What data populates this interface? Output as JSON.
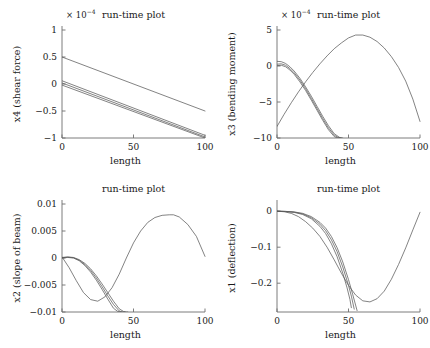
{
  "figure": {
    "title_common": "run-time plot",
    "xlabel_common": "length",
    "background": "#ffffff",
    "curve_color": "#5a5a5a",
    "axis_color": "#6e6e6e"
  },
  "chart_data": [
    {
      "id": "shear-force",
      "position": "top-left",
      "type": "line",
      "title": "run-time plot",
      "xlabel": "length",
      "ylabel": "x4 (shear force)",
      "exponent_label": "× 10",
      "exponent_power": "−4",
      "y_scale": 0.0001,
      "xlim": [
        0,
        100
      ],
      "ylim": [
        -1,
        1
      ],
      "xticks": [
        0,
        50,
        100
      ],
      "xticklabels": [
        "0",
        "50",
        "100"
      ],
      "yticks": [
        -1,
        -0.5,
        0,
        0.5,
        1
      ],
      "yticklabels": [
        "−1",
        "−0.5",
        "0",
        "0.5",
        "1"
      ],
      "grid": false,
      "legend": "none",
      "series": [
        {
          "name": "curve-1",
          "x": [
            0,
            100
          ],
          "values": [
            0.5,
            -0.5
          ]
        },
        {
          "name": "curve-2",
          "x": [
            0,
            100
          ],
          "values": [
            0.06,
            -0.95
          ]
        },
        {
          "name": "curve-3",
          "x": [
            0,
            100
          ],
          "values": [
            0.02,
            -0.98
          ]
        },
        {
          "name": "curve-4",
          "x": [
            0,
            100
          ],
          "values": [
            -0.02,
            -1.0
          ]
        }
      ]
    },
    {
      "id": "bending-moment",
      "position": "top-right",
      "type": "line",
      "title": "run-time plot",
      "xlabel": "length",
      "ylabel": "x3 (bending moment)",
      "exponent_label": "× 10",
      "exponent_power": "−4",
      "y_scale": 0.0001,
      "xlim": [
        0,
        100
      ],
      "ylim": [
        -10,
        5
      ],
      "xticks": [
        0,
        50,
        100
      ],
      "xticklabels": [
        "0",
        "50",
        "100"
      ],
      "yticks": [
        -10,
        -5,
        0,
        5
      ],
      "yticklabels": [
        "−10",
        "−5",
        "0",
        "5"
      ],
      "grid": false,
      "legend": "none",
      "series": [
        {
          "name": "parabola",
          "x": [
            0,
            5,
            10,
            15,
            20,
            25,
            30,
            35,
            40,
            45,
            50,
            55,
            60,
            65,
            70,
            75,
            80,
            85,
            90,
            95,
            100
          ],
          "values": [
            -8.4,
            -6.7,
            -5.1,
            -3.6,
            -2.2,
            -0.9,
            0.3,
            1.4,
            2.4,
            3.2,
            3.9,
            4.3,
            4.3,
            4.0,
            3.4,
            2.5,
            1.3,
            -0.2,
            -2.1,
            -4.6,
            -7.7
          ]
        },
        {
          "name": "curve-a",
          "x": [
            0,
            3,
            6,
            9,
            12,
            16,
            20,
            24,
            28,
            32,
            36,
            40,
            44,
            46
          ],
          "values": [
            0.65,
            0.6,
            0.35,
            -0.1,
            -0.7,
            -1.7,
            -2.9,
            -4.2,
            -5.6,
            -7.0,
            -8.3,
            -9.4,
            -9.95,
            -10
          ]
        },
        {
          "name": "curve-b",
          "x": [
            0,
            3,
            6,
            9,
            12,
            16,
            20,
            24,
            28,
            32,
            36,
            40,
            43,
            45
          ],
          "values": [
            0.25,
            0.3,
            0.1,
            -0.35,
            -0.95,
            -1.95,
            -3.15,
            -4.5,
            -5.9,
            -7.3,
            -8.6,
            -9.6,
            -9.95,
            -10
          ]
        },
        {
          "name": "curve-c",
          "x": [
            0,
            3,
            6,
            9,
            12,
            16,
            20,
            24,
            28,
            32,
            36,
            40,
            42,
            44
          ],
          "values": [
            0.05,
            0.1,
            -0.1,
            -0.55,
            -1.15,
            -2.2,
            -3.4,
            -4.75,
            -6.15,
            -7.55,
            -8.85,
            -9.8,
            -9.98,
            -10
          ]
        }
      ]
    },
    {
      "id": "slope-of-beam",
      "position": "bottom-left",
      "type": "line",
      "title": "run-time plot",
      "xlabel": "length",
      "ylabel": "x2 (slope of beam)",
      "exponent_label": "",
      "exponent_power": "",
      "y_scale": 1,
      "xlim": [
        0,
        100
      ],
      "ylim": [
        -0.01,
        0.01
      ],
      "xticks": [
        0,
        50,
        100
      ],
      "xticklabels": [
        "0",
        "50",
        "100"
      ],
      "yticks": [
        -0.01,
        -0.005,
        0,
        0.005,
        0.01
      ],
      "yticklabels": [
        "−0.01",
        "−0.005",
        "0",
        "0.005",
        "0.01"
      ],
      "grid": false,
      "legend": "none",
      "series": [
        {
          "name": "dip-and-rise",
          "x": [
            0,
            5,
            10,
            15,
            20,
            25,
            30,
            35,
            40,
            45,
            50,
            55,
            60,
            65,
            70,
            75,
            78,
            82,
            88,
            94,
            100
          ],
          "values": [
            0.0002,
            -0.0018,
            -0.0042,
            -0.0064,
            -0.0077,
            -0.008,
            -0.0072,
            -0.0055,
            -0.003,
            0.0,
            0.0028,
            0.005,
            0.0066,
            0.0075,
            0.0079,
            0.008,
            0.008,
            0.0076,
            0.0062,
            0.004,
            0.0003
          ]
        },
        {
          "name": "curve-a",
          "x": [
            0,
            4,
            8,
            12,
            16,
            20,
            24,
            28,
            32,
            36,
            40,
            43,
            45,
            46
          ],
          "values": [
            0.0001,
            0.0002,
            0.0001,
            -0.0003,
            -0.001,
            -0.002,
            -0.0033,
            -0.0048,
            -0.0064,
            -0.008,
            -0.0094,
            -0.0099,
            -0.01,
            -0.01
          ]
        },
        {
          "name": "curve-b",
          "x": [
            0,
            4,
            8,
            12,
            16,
            20,
            24,
            28,
            32,
            36,
            40,
            42,
            44
          ],
          "values": [
            5e-05,
            0.00015,
            5e-05,
            -0.0004,
            -0.0012,
            -0.0023,
            -0.0037,
            -0.0053,
            -0.007,
            -0.0086,
            -0.0098,
            -0.01,
            -0.01
          ]
        },
        {
          "name": "curve-c",
          "x": [
            0,
            4,
            8,
            12,
            16,
            20,
            24,
            28,
            32,
            36,
            39,
            41,
            42
          ],
          "values": [
            0.0,
            0.0001,
            0.0,
            -0.0005,
            -0.0014,
            -0.0026,
            -0.0041,
            -0.0058,
            -0.0076,
            -0.0093,
            -0.0099,
            -0.01,
            -0.01
          ]
        }
      ]
    },
    {
      "id": "deflection",
      "position": "bottom-right",
      "type": "line",
      "title": "run-time plot",
      "xlabel": "length",
      "ylabel": "x1 (deflection)",
      "exponent_label": "",
      "exponent_power": "",
      "y_scale": 1,
      "xlim": [
        0,
        100
      ],
      "ylim": [
        -0.28,
        0.02
      ],
      "xticks": [
        0,
        50,
        100
      ],
      "xticklabels": [
        "0",
        "50",
        "100"
      ],
      "yticks": [
        -0.2,
        -0.1,
        0
      ],
      "yticklabels": [
        "−0.2",
        "−0.1",
        "0"
      ],
      "grid": false,
      "legend": "none",
      "series": [
        {
          "name": "wide-dip",
          "x": [
            0,
            5,
            10,
            15,
            20,
            25,
            30,
            35,
            40,
            45,
            50,
            55,
            60,
            65,
            70,
            75,
            80,
            85,
            90,
            95,
            100
          ],
          "values": [
            0.0,
            -0.0015,
            -0.006,
            -0.015,
            -0.029,
            -0.047,
            -0.07,
            -0.1,
            -0.135,
            -0.172,
            -0.206,
            -0.233,
            -0.249,
            -0.252,
            -0.243,
            -0.222,
            -0.189,
            -0.148,
            -0.102,
            -0.052,
            -0.003
          ]
        },
        {
          "name": "curve-a",
          "x": [
            0,
            6,
            12,
            18,
            24,
            30,
            34,
            38,
            42,
            46,
            50,
            53,
            56
          ],
          "values": [
            0.0,
            -0.0005,
            -0.002,
            -0.006,
            -0.015,
            -0.031,
            -0.047,
            -0.07,
            -0.101,
            -0.141,
            -0.19,
            -0.232,
            -0.276
          ]
        },
        {
          "name": "curve-b",
          "x": [
            0,
            6,
            12,
            18,
            24,
            30,
            34,
            38,
            42,
            46,
            50,
            52,
            54
          ],
          "values": [
            0.0,
            -0.0007,
            -0.0026,
            -0.0075,
            -0.018,
            -0.036,
            -0.054,
            -0.079,
            -0.112,
            -0.155,
            -0.206,
            -0.236,
            -0.272
          ]
        },
        {
          "name": "curve-c",
          "x": [
            0,
            6,
            12,
            18,
            24,
            30,
            34,
            38,
            42,
            46,
            49,
            51,
            52
          ],
          "values": [
            0.0,
            -0.0009,
            -0.0033,
            -0.0092,
            -0.021,
            -0.042,
            -0.062,
            -0.09,
            -0.126,
            -0.172,
            -0.213,
            -0.245,
            -0.268
          ]
        }
      ]
    }
  ]
}
